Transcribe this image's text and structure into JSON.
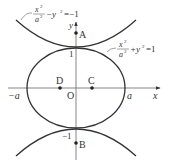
{
  "diagram": {
    "axes": {
      "x_label": "x",
      "y_label": "y",
      "origin_label": "O",
      "x_neg_tick": "−a",
      "x_pos_tick": "a",
      "y_pos_tick": "1",
      "y_neg_tick": "−1"
    },
    "curves": {
      "ellipse": {
        "eq_num": "x",
        "eq_sup": "2",
        "eq_den": "a",
        "eq_den_sup": "2",
        "eq_rest": "+y",
        "eq_rest_sup": "2",
        "eq_rhs": "=1"
      },
      "hyperbola": {
        "eq_num": "x",
        "eq_sup": "2",
        "eq_den": "a",
        "eq_den_sup": "2",
        "eq_rest": "−y",
        "eq_rest_sup": "2",
        "eq_rhs": "=−1"
      }
    },
    "points": {
      "A": "A",
      "B": "B",
      "C": "C",
      "D": "D"
    },
    "colors": {
      "stroke": "#333333",
      "axis": "#555555"
    }
  }
}
